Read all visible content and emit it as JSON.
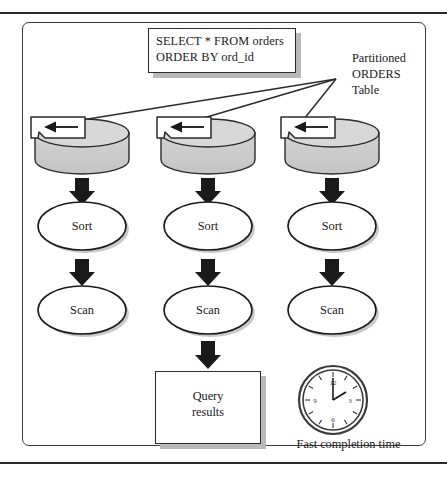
{
  "figure": {
    "query_box": {
      "line1": "SELECT * FROM orders",
      "line2": "ORDER BY ord_id"
    },
    "annotation": {
      "line1": "Partitioned",
      "line2": "ORDERS",
      "line3": "Table"
    },
    "columns": [
      {
        "partition_label": "",
        "sort_label": "Sort",
        "scan_label": "Scan"
      },
      {
        "partition_label": "",
        "sort_label": "Sort",
        "scan_label": "Scan"
      },
      {
        "partition_label": "",
        "sort_label": "Sort",
        "scan_label": "Scan"
      }
    ],
    "result_box": {
      "line1": "Query",
      "line2": "results"
    },
    "clock": {
      "caption": "Fast completion time",
      "numerals": [
        "12",
        "3",
        "6",
        "9"
      ],
      "hour_hand": 2,
      "minute_hand": 12
    },
    "colors": {
      "cylinder_fill": "#cdcdcd",
      "cylinder_top": "#d8d8d8",
      "stroke": "#2b2b2b",
      "shadow": "#b9b9b9",
      "background": "#ffffff"
    }
  }
}
